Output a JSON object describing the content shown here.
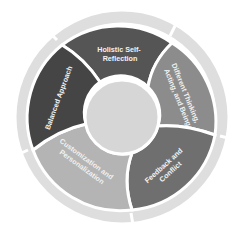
{
  "diagram": {
    "type": "circular-cycle",
    "center_label": "",
    "segments": [
      {
        "label_line1": "Holistic Self-",
        "label_line2": "Reflection",
        "color": "#555555"
      },
      {
        "label_line1": "Different Thinking,",
        "label_line2": "Acting, and Being",
        "color": "#8c8c8c"
      },
      {
        "label_line1": "Feedback and",
        "label_line2": "Conflict",
        "color": "#6f6f6f"
      },
      {
        "label_line1": "Customization and",
        "label_line2": "Personalization",
        "color": "#b4b4b4"
      },
      {
        "label_line1": "Balanced Approach",
        "label_line2": "",
        "color": "#454545"
      }
    ],
    "colors": {
      "outer_ring": "#dedede",
      "center": "#d6d6d6",
      "divider": "#ffffff"
    }
  }
}
